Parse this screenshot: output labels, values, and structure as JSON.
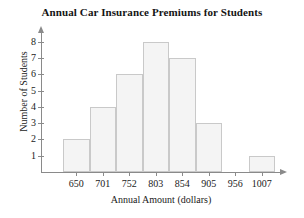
{
  "chart_data": {
    "type": "bar",
    "title": "Annual Car Insurance Premiums for Students",
    "xlabel": "Annual Amount (dollars)",
    "ylabel": "Number of Students",
    "categories": [
      "650",
      "701",
      "752",
      "803",
      "854",
      "905",
      "956",
      "1007"
    ],
    "values": [
      2,
      4,
      6,
      8,
      7,
      3,
      0,
      1
    ],
    "ylim": [
      0,
      8.6
    ],
    "y_ticks": [
      "1",
      "2",
      "3",
      "4",
      "5",
      "6",
      "7",
      "8"
    ],
    "y_tick_values": [
      1,
      2,
      3,
      4,
      5,
      6,
      7,
      8
    ],
    "bin_width": 51,
    "grid": false,
    "legend": false,
    "axis_arrows": true,
    "colors": {
      "bar_fill": "#f4f4f4",
      "bar_border": "#c9c9c9",
      "axis": "#8a8a8a",
      "text": "#1a1a1a",
      "background": "#ffffff"
    }
  }
}
